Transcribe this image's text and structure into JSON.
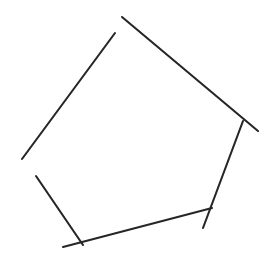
{
  "figure": {
    "canvas": {
      "width": 277,
      "height": 273,
      "background_color": "#ffffff"
    },
    "stroke": {
      "color": "#262626",
      "width": 2.1,
      "linecap": "round",
      "style": "solid"
    },
    "shape_type": "pentagon",
    "vertex_count": 5,
    "segment_count": 5,
    "vertices": [
      {
        "name": "top",
        "x": 113,
        "y": 38
      },
      {
        "name": "right",
        "x": 242,
        "y": 124
      },
      {
        "name": "bottom-right",
        "x": 209,
        "y": 211
      },
      {
        "name": "bottom-left",
        "x": 81,
        "y": 242
      },
      {
        "name": "left",
        "x": 36,
        "y": 176
      }
    ],
    "segments": [
      {
        "name": "top-right-edge",
        "from": "top",
        "to": "right",
        "x1": 122,
        "y1": 17,
        "x2": 258,
        "y2": 131,
        "overshoot_start": 22,
        "overshoot_end": 21
      },
      {
        "name": "right-edge",
        "from": "right",
        "to": "bottom-right",
        "x1": 243,
        "y1": 121,
        "x2": 203,
        "y2": 228,
        "overshoot_start": 3,
        "overshoot_end": 18
      },
      {
        "name": "bottom-edge",
        "from": "bottom-right",
        "to": "bottom-left",
        "x1": 212,
        "y1": 208,
        "x2": 63,
        "y2": 247,
        "overshoot_start": 4,
        "overshoot_end": 19
      },
      {
        "name": "lower-left-edge",
        "from": "bottom-left",
        "to": "left",
        "x1": 83,
        "y1": 245,
        "x2": 36,
        "y2": 176,
        "overshoot_start": 4,
        "overshoot_end": 0
      },
      {
        "name": "upper-left-edge",
        "from": "left",
        "to": "top",
        "x1": 22,
        "y1": 159,
        "x2": 115,
        "y2": 33,
        "overshoot_start": 22,
        "overshoot_end": 6
      }
    ]
  }
}
